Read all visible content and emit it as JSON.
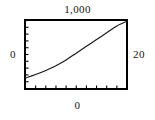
{
  "figure": {
    "background_color": "#ffffff",
    "frame_color": "#000000",
    "curve_color": "#1a1a1a"
  },
  "labels": {
    "top": "1,000",
    "left": "0",
    "right": "20",
    "bottom": "0"
  },
  "chart_data": {
    "type": "line",
    "title": "",
    "xlabel": "0",
    "ylabel": "0",
    "top_label": "1,000",
    "right_label": "20",
    "grid": false,
    "legend": null,
    "xlim": [
      0,
      20
    ],
    "ylim": [
      0,
      1000
    ],
    "axis_ticks": {
      "x_tick_count": 10,
      "y_tick_count": 10,
      "tick_direction": "inward",
      "x_tick_labels": [
        "0"
      ],
      "y_tick_labels": [
        "0",
        "1,000"
      ]
    },
    "series": [
      {
        "name": "curve",
        "x": [
          0,
          2,
          4,
          6,
          8,
          10,
          12,
          14,
          16,
          18,
          20
        ],
        "y": [
          155,
          205,
          265,
          335,
          420,
          520,
          620,
          720,
          820,
          920,
          990
        ]
      }
    ]
  }
}
